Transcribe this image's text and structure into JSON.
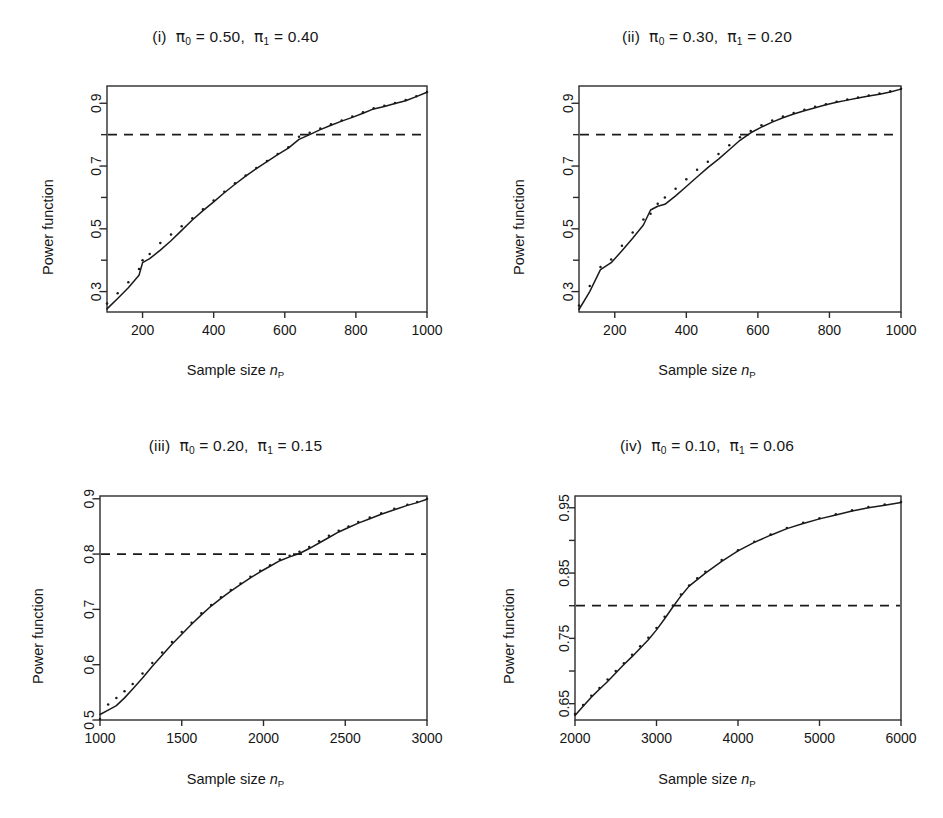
{
  "figure": {
    "panel_count": 4,
    "shared": {
      "ylabel": "Power function",
      "xlabel_prefix": "Sample size ",
      "xlabel_symbol": "n",
      "xlabel_subscript": "P",
      "target_power_label": "0.8",
      "series_solid_name": "solid-power-curve",
      "series_dotted_name": "dotted-simulated-power",
      "line_color": "#1a1a1a"
    }
  },
  "chart_data": [
    {
      "id": "panel-i",
      "type": "line",
      "title": "(i)  π0 = 0.50,  π1 = 0.40",
      "title_label": "(i)",
      "pi0": "0.50",
      "pi1": "0.40",
      "xlabel": "Sample size nP",
      "ylabel": "Power function",
      "xlim": [
        100,
        1000
      ],
      "ylim": [
        0.235,
        0.955
      ],
      "xticks": [
        200,
        400,
        600,
        800,
        1000
      ],
      "xticklabels": [
        "200",
        "400",
        "600",
        "800",
        "1000"
      ],
      "yticks": [
        0.3,
        0.4,
        0.5,
        0.6,
        0.7,
        0.8,
        0.9
      ],
      "yticklabels": [
        "0.3",
        "",
        "0.5",
        "",
        "0.7",
        "",
        "0.9"
      ],
      "grid": false,
      "legend": "none",
      "hline": 0.8,
      "hline_style": "dashed",
      "crossing_x": 620,
      "x": [
        100,
        130,
        160,
        190,
        200,
        220,
        250,
        280,
        310,
        340,
        370,
        400,
        430,
        460,
        490,
        520,
        550,
        580,
        610,
        640,
        670,
        700,
        730,
        760,
        790,
        820,
        850,
        880,
        910,
        940,
        970,
        1000
      ],
      "series": [
        {
          "name": "solid-power-curve",
          "style": "solid",
          "values": [
            0.245,
            0.278,
            0.312,
            0.352,
            0.392,
            0.405,
            0.432,
            0.462,
            0.495,
            0.528,
            0.558,
            0.586,
            0.615,
            0.642,
            0.668,
            0.692,
            0.714,
            0.736,
            0.757,
            0.785,
            0.8,
            0.816,
            0.83,
            0.843,
            0.855,
            0.868,
            0.882,
            0.89,
            0.899,
            0.908,
            0.921,
            0.935
          ]
        },
        {
          "name": "dotted-simulated-power",
          "style": "dotted",
          "values": [
            0.262,
            0.295,
            0.33,
            0.372,
            0.4,
            0.42,
            0.455,
            0.482,
            0.508,
            0.534,
            0.562,
            0.59,
            0.618,
            0.645,
            0.67,
            0.694,
            0.716,
            0.738,
            0.76,
            0.793,
            0.806,
            0.82,
            0.833,
            0.845,
            0.858,
            0.871,
            0.884,
            0.892,
            0.901,
            0.91,
            0.922,
            0.936
          ]
        }
      ]
    },
    {
      "id": "panel-ii",
      "type": "line",
      "title": "(ii)  π0 = 0.30,  π1 = 0.20",
      "title_label": "(ii)",
      "pi0": "0.30",
      "pi1": "0.20",
      "xlabel": "Sample size nP",
      "ylabel": "Power function",
      "xlim": [
        100,
        1000
      ],
      "ylim": [
        0.235,
        0.955
      ],
      "xticks": [
        200,
        400,
        600,
        800,
        1000
      ],
      "xticklabels": [
        "200",
        "400",
        "600",
        "800",
        "1000"
      ],
      "yticks": [
        0.3,
        0.4,
        0.5,
        0.6,
        0.7,
        0.8,
        0.9
      ],
      "yticklabels": [
        "0.3",
        "",
        "0.5",
        "",
        "0.7",
        "",
        "0.9"
      ],
      "grid": false,
      "legend": "none",
      "hline": 0.8,
      "hline_style": "dashed",
      "crossing_x": 565,
      "x": [
        100,
        130,
        160,
        190,
        220,
        250,
        280,
        300,
        320,
        340,
        370,
        400,
        430,
        460,
        490,
        520,
        550,
        580,
        610,
        640,
        670,
        700,
        730,
        760,
        790,
        820,
        850,
        880,
        910,
        940,
        970,
        1000
      ],
      "series": [
        {
          "name": "solid-power-curve",
          "style": "solid",
          "values": [
            0.243,
            0.3,
            0.37,
            0.392,
            0.43,
            0.47,
            0.512,
            0.56,
            0.572,
            0.578,
            0.605,
            0.635,
            0.665,
            0.695,
            0.722,
            0.752,
            0.782,
            0.806,
            0.824,
            0.84,
            0.854,
            0.866,
            0.876,
            0.886,
            0.895,
            0.903,
            0.91,
            0.917,
            0.923,
            0.929,
            0.936,
            0.945
          ]
        },
        {
          "name": "dotted-simulated-power",
          "style": "dotted",
          "values": [
            0.256,
            0.318,
            0.378,
            0.402,
            0.446,
            0.488,
            0.53,
            0.548,
            0.58,
            0.6,
            0.628,
            0.658,
            0.688,
            0.714,
            0.738,
            0.766,
            0.792,
            0.812,
            0.83,
            0.845,
            0.858,
            0.869,
            0.879,
            0.889,
            0.897,
            0.905,
            0.912,
            0.918,
            0.925,
            0.931,
            0.938,
            0.946
          ]
        }
      ]
    },
    {
      "id": "panel-iii",
      "type": "line",
      "title": "(iii)  π0 = 0.20,  π1 = 0.15",
      "title_label": "(iii)",
      "pi0": "0.20",
      "pi1": "0.15",
      "xlabel": "Sample size nP",
      "ylabel": "Power function",
      "xlim": [
        1000,
        3000
      ],
      "ylim": [
        0.5,
        0.905
      ],
      "xticks": [
        1000,
        1500,
        2000,
        2500,
        3000
      ],
      "xticklabels": [
        "1000",
        "1500",
        "2000",
        "2500",
        "3000"
      ],
      "yticks": [
        0.5,
        0.6,
        0.7,
        0.8,
        0.9
      ],
      "yticklabels": [
        "0.5",
        "0.6",
        "0.7",
        "0.8",
        "0.9"
      ],
      "grid": false,
      "legend": "none",
      "hline": 0.8,
      "hline_style": "dashed",
      "crossing_x": 2230,
      "x": [
        1000,
        1050,
        1100,
        1150,
        1200,
        1260,
        1320,
        1380,
        1440,
        1500,
        1560,
        1620,
        1680,
        1740,
        1800,
        1860,
        1920,
        1980,
        2040,
        2100,
        2160,
        2220,
        2280,
        2340,
        2400,
        2460,
        2520,
        2580,
        2650,
        2720,
        2800,
        2880,
        2940,
        3000
      ],
      "series": [
        {
          "name": "solid-power-curve",
          "style": "solid",
          "values": [
            0.51,
            0.518,
            0.526,
            0.54,
            0.556,
            0.576,
            0.597,
            0.617,
            0.637,
            0.655,
            0.673,
            0.69,
            0.706,
            0.72,
            0.733,
            0.745,
            0.757,
            0.768,
            0.778,
            0.788,
            0.795,
            0.801,
            0.81,
            0.82,
            0.83,
            0.84,
            0.848,
            0.856,
            0.864,
            0.872,
            0.88,
            0.888,
            0.893,
            0.899
          ]
        },
        {
          "name": "dotted-simulated-power",
          "style": "dotted",
          "values": [
            0.502,
            0.528,
            0.54,
            0.552,
            0.565,
            0.584,
            0.603,
            0.622,
            0.641,
            0.659,
            0.676,
            0.693,
            0.708,
            0.722,
            0.735,
            0.747,
            0.759,
            0.77,
            0.78,
            0.79,
            0.797,
            0.804,
            0.813,
            0.823,
            0.833,
            0.842,
            0.85,
            0.858,
            0.866,
            0.874,
            0.882,
            0.889,
            0.894,
            0.9
          ]
        }
      ]
    },
    {
      "id": "panel-iv",
      "type": "line",
      "title": "(iv)  π0 = 0.10,  π1 = 0.06",
      "title_label": "(iv)",
      "pi0": "0.10",
      "pi1": "0.06",
      "xlabel": "Sample size nP",
      "ylabel": "Power function",
      "xlim": [
        2000,
        6000
      ],
      "ylim": [
        0.625,
        0.968
      ],
      "xticks": [
        2000,
        3000,
        4000,
        5000,
        6000
      ],
      "xticklabels": [
        "2000",
        "3000",
        "4000",
        "5000",
        "6000"
      ],
      "yticks": [
        0.6,
        0.65,
        0.7,
        0.75,
        0.8,
        0.85,
        0.9,
        0.95
      ],
      "yticklabels": [
        "",
        "0.65",
        "",
        "0.75",
        "",
        "0.85",
        "",
        "0.95"
      ],
      "grid": false,
      "legend": "none",
      "hline": 0.8,
      "hline_style": "dashed",
      "crossing_x": 3200,
      "x": [
        2000,
        2100,
        2200,
        2300,
        2400,
        2500,
        2600,
        2700,
        2800,
        2900,
        3000,
        3100,
        3200,
        3300,
        3400,
        3500,
        3600,
        3800,
        4000,
        4200,
        4400,
        4600,
        4800,
        5000,
        5200,
        5400,
        5600,
        5800,
        6000
      ],
      "series": [
        {
          "name": "solid-power-curve",
          "style": "solid",
          "values": [
            0.632,
            0.646,
            0.66,
            0.672,
            0.684,
            0.697,
            0.71,
            0.722,
            0.735,
            0.748,
            0.763,
            0.78,
            0.798,
            0.815,
            0.83,
            0.84,
            0.85,
            0.868,
            0.884,
            0.897,
            0.908,
            0.918,
            0.926,
            0.933,
            0.939,
            0.945,
            0.95,
            0.954,
            0.958
          ]
        },
        {
          "name": "dotted-simulated-power",
          "style": "dotted",
          "values": [
            0.634,
            0.648,
            0.662,
            0.674,
            0.687,
            0.7,
            0.712,
            0.725,
            0.738,
            0.751,
            0.766,
            0.783,
            0.8,
            0.817,
            0.831,
            0.842,
            0.852,
            0.87,
            0.885,
            0.898,
            0.909,
            0.919,
            0.927,
            0.934,
            0.94,
            0.946,
            0.951,
            0.955,
            0.959
          ]
        }
      ]
    }
  ]
}
